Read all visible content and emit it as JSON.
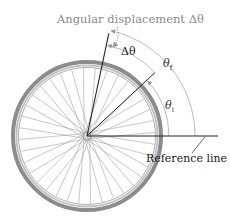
{
  "diagram": {
    "title": "Angular displacement Δθ",
    "delta_label": "Δθ",
    "theta_final_label": "θ",
    "theta_final_sub": "f",
    "theta_initial_label": "θ",
    "theta_initial_sub": "i",
    "reference_label": "Reference line"
  },
  "geometry": {
    "center": [
      87,
      136
    ],
    "tire_radius": 74,
    "spoke_count": 36,
    "theta_initial_deg": 43,
    "theta_final_deg": 78
  },
  "colors": {
    "tire": "#8c8c8c",
    "rim": "#b5b5b5",
    "spoke": "#9a9a9a",
    "line": "#222222",
    "arc": "#aaaaaa",
    "title": "#8a8a8a"
  }
}
